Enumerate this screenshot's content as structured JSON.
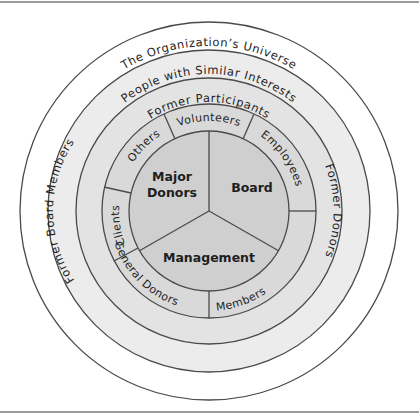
{
  "diagram": {
    "type": "concentric-circles",
    "rings": [
      {
        "id": "universe",
        "label": "The Organization’s Universe",
        "fill": "#ffffff"
      },
      {
        "id": "similar-interests",
        "label": "People with Similar Interests",
        "fill": "#ececec"
      },
      {
        "id": "former",
        "label_top": "Former Participants",
        "label_left": "Former Board Members",
        "label_right": "Former Donors",
        "fill": "#e3e3e3"
      }
    ],
    "middle_ring": {
      "fill": "#d9d9d9",
      "segments": [
        {
          "label": "Volunteers"
        },
        {
          "label": "Employees"
        },
        {
          "label": "General Donors"
        },
        {
          "label": "Members"
        },
        {
          "label": "Clients"
        },
        {
          "label": "Others"
        }
      ]
    },
    "core": {
      "fill": "#cfcfcf",
      "segments": [
        {
          "line1": "Major",
          "line2": "Donors"
        },
        {
          "line1": "Board"
        },
        {
          "line1": "Management"
        }
      ]
    },
    "line_color": "#4a4a4a"
  }
}
